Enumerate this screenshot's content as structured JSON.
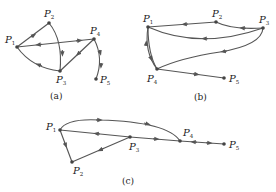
{
  "figures": [
    {
      "id": "a",
      "caption": "(a)",
      "nodes": [
        {
          "name": "P",
          "sub": "1",
          "x": 17,
          "y": 47,
          "lx": 6,
          "ly": 42
        },
        {
          "name": "P",
          "sub": "2",
          "x": 49,
          "y": 23,
          "lx": 45,
          "ly": 17
        },
        {
          "name": "P",
          "sub": "3",
          "x": 60,
          "y": 71,
          "lx": 57,
          "ly": 83
        },
        {
          "name": "P",
          "sub": "4",
          "x": 94,
          "y": 39,
          "lx": 90,
          "ly": 33
        },
        {
          "name": "P",
          "sub": "5",
          "x": 96,
          "y": 79,
          "lx": 101,
          "ly": 83
        }
      ],
      "edges": [
        {
          "from": "P1",
          "to": "P2",
          "arrows": [
            "toward P2"
          ]
        },
        {
          "from": "P2",
          "to": "P3",
          "arrows": [
            "toward P3"
          ]
        },
        {
          "from": "P1",
          "to": "P4",
          "arrows": [
            "toward P1",
            "toward P4"
          ]
        },
        {
          "from": "P4",
          "to": "P3",
          "arrows": [
            "toward P3"
          ]
        },
        {
          "from": "P3",
          "to": "P1",
          "arrows": [
            "toward P1"
          ]
        },
        {
          "from": "P4",
          "to": "P5",
          "arrows": [
            "toward P5",
            "toward P5"
          ]
        }
      ]
    },
    {
      "id": "b",
      "caption": "(b)",
      "nodes": [
        {
          "name": "P",
          "sub": "1",
          "x": 148,
          "y": 27,
          "lx": 142,
          "ly": 21
        },
        {
          "name": "P",
          "sub": "2",
          "x": 216,
          "y": 22,
          "lx": 213,
          "ly": 16
        },
        {
          "name": "P",
          "sub": "3",
          "x": 263,
          "y": 28,
          "lx": 260,
          "ly": 22
        },
        {
          "name": "P",
          "sub": "4",
          "x": 157,
          "y": 69,
          "lx": 149,
          "ly": 82
        },
        {
          "name": "P",
          "sub": "5",
          "x": 224,
          "y": 78,
          "lx": 230,
          "ly": 82
        }
      ],
      "edges": [
        {
          "from": "P2",
          "to": "P1",
          "arrows": [
            "toward P1"
          ]
        },
        {
          "from": "P3",
          "to": "P2",
          "arrows": [
            "toward P2"
          ]
        },
        {
          "from": "P3",
          "to": "P1",
          "arrows": [
            "toward P1"
          ]
        },
        {
          "from": "P3",
          "to": "P4",
          "arrows": [
            "toward P4"
          ]
        },
        {
          "from": "P4",
          "to": "P1",
          "arrows": [
            "toward P1"
          ]
        },
        {
          "from": "P1",
          "to": "P4",
          "arrows": [
            "toward P4"
          ]
        },
        {
          "from": "P4",
          "to": "P5",
          "arrows": [
            "toward P5"
          ]
        }
      ]
    },
    {
      "id": "c",
      "caption": "(c)",
      "nodes": [
        {
          "name": "P",
          "sub": "1",
          "x": 60,
          "y": 130,
          "lx": 47,
          "ly": 129
        },
        {
          "name": "P",
          "sub": "2",
          "x": 72,
          "y": 162,
          "lx": 73,
          "ly": 174
        },
        {
          "name": "P",
          "sub": "3",
          "x": 130,
          "y": 137,
          "lx": 130,
          "ly": 150
        },
        {
          "name": "P",
          "sub": "4",
          "x": 180,
          "y": 141,
          "lx": 183,
          "ly": 135
        },
        {
          "name": "P",
          "sub": "5",
          "x": 224,
          "y": 144,
          "lx": 230,
          "ly": 148
        }
      ],
      "edges": [
        {
          "from": "P1",
          "to": "P4",
          "arrows": [
            "toward P4",
            "toward P4"
          ],
          "curved": true
        },
        {
          "from": "P3",
          "to": "P1",
          "arrows": [
            "toward P1"
          ]
        },
        {
          "from": "P3",
          "to": "P4",
          "arrows": [
            "toward P4"
          ]
        },
        {
          "from": "P1",
          "to": "P2",
          "arrows": [
            "toward P2"
          ]
        },
        {
          "from": "P3",
          "to": "P2",
          "arrows": [
            "toward P2"
          ]
        },
        {
          "from": "P4",
          "to": "P5",
          "arrows": [
            "toward P4",
            "toward P5"
          ]
        }
      ]
    }
  ],
  "captions": {
    "a": "(a)",
    "b": "(b)",
    "c": "(c)"
  },
  "labels": {
    "P": "P",
    "s1": "1",
    "s2": "2",
    "s3": "3",
    "s4": "4",
    "s5": "5"
  },
  "colors": {
    "edge": "#555555",
    "node": "#444444",
    "text": "#222222"
  }
}
